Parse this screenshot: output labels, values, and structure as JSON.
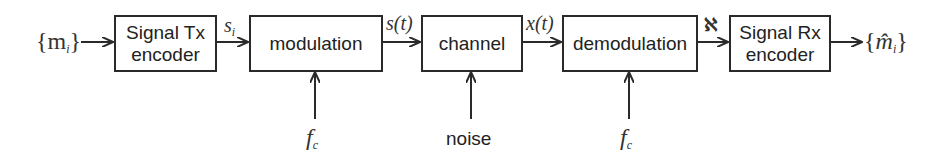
{
  "diagram": {
    "type": "communication-system-block-diagram",
    "input": {
      "label": "{m",
      "sub": "i",
      "close": "}"
    },
    "output": {
      "label": "{m̂",
      "sub": "i",
      "close": "}"
    },
    "blocks": [
      {
        "id": "tx-encoder",
        "line1": "Signal Tx",
        "line2": "encoder"
      },
      {
        "id": "modulation",
        "line1": "modulation"
      },
      {
        "id": "channel",
        "line1": "channel"
      },
      {
        "id": "demodulation",
        "line1": "demodulation"
      },
      {
        "id": "rx-encoder",
        "line1": "Signal Rx",
        "line2": "encoder"
      }
    ],
    "edges": [
      {
        "from": "input",
        "to": "tx-encoder",
        "label": ""
      },
      {
        "from": "tx-encoder",
        "to": "modulation",
        "label": "s",
        "sub": "i"
      },
      {
        "from": "modulation",
        "to": "channel",
        "label": "s(t)"
      },
      {
        "from": "channel",
        "to": "demodulation",
        "label": "x(t)"
      },
      {
        "from": "demodulation",
        "to": "rx-encoder",
        "label": "ℵ"
      },
      {
        "from": "rx-encoder",
        "to": "output",
        "label": ""
      }
    ],
    "side_inputs": [
      {
        "to": "modulation",
        "label": "f",
        "sub": "c"
      },
      {
        "to": "channel",
        "label": "noise"
      },
      {
        "to": "demodulation",
        "label": "f",
        "sub": "c"
      }
    ],
    "colors": {
      "stroke": "#2a2a2a",
      "text": "#222222",
      "background": "#ffffff"
    }
  }
}
